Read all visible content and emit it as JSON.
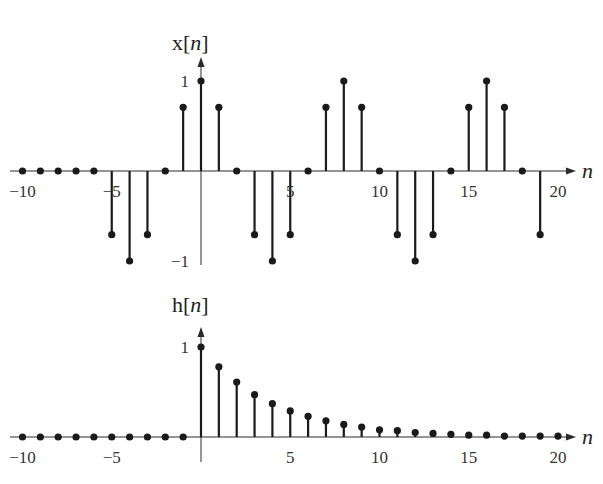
{
  "chart_data": [
    {
      "type": "stem",
      "title": "x[n]",
      "title_parts": {
        "prefix": "x[",
        "var": "n",
        "suffix": "]"
      },
      "xlabel": "n",
      "ylabel": "x[n]",
      "xlim": [
        -10,
        20
      ],
      "ylim": [
        -1,
        1
      ],
      "x_ticks": [
        -10,
        -5,
        5,
        10,
        15,
        20
      ],
      "x_tick_labels": [
        "−10",
        "−5",
        "5",
        "10",
        "15",
        "20"
      ],
      "y_ticks": [
        1,
        -1
      ],
      "y_tick_labels": [
        "1",
        "−1"
      ],
      "x": [
        -10,
        -9,
        -8,
        -7,
        -6,
        -5,
        -4,
        -3,
        -2,
        -1,
        0,
        1,
        2,
        3,
        4,
        5,
        6,
        7,
        8,
        9,
        10,
        11,
        12,
        13,
        14,
        15,
        16,
        17,
        18,
        19
      ],
      "values": [
        0,
        0,
        0,
        0,
        0,
        -0.707,
        -1,
        -0.707,
        0,
        0.707,
        1,
        0.707,
        0,
        -0.707,
        -1,
        -0.707,
        0,
        0.707,
        1,
        0.707,
        0,
        -0.707,
        -1,
        -0.707,
        0,
        0.707,
        1,
        0.707,
        0,
        -0.707
      ],
      "grid": false,
      "legend": null
    },
    {
      "type": "stem",
      "title": "h[n]",
      "title_parts": {
        "prefix": "h[",
        "var": "n",
        "suffix": "]"
      },
      "xlabel": "n",
      "ylabel": "h[n]",
      "xlim": [
        -10,
        20
      ],
      "ylim": [
        0,
        1
      ],
      "x_ticks": [
        -10,
        -5,
        5,
        10,
        15,
        20
      ],
      "x_tick_labels": [
        "−10",
        "−5",
        "5",
        "10",
        "15",
        "20"
      ],
      "y_ticks": [
        1
      ],
      "y_tick_labels": [
        "1"
      ],
      "x": [
        -10,
        -9,
        -8,
        -7,
        -6,
        -5,
        -4,
        -3,
        -2,
        -1,
        0,
        1,
        2,
        3,
        4,
        5,
        6,
        7,
        8,
        9,
        10,
        11,
        12,
        13,
        14,
        15,
        16,
        17,
        18,
        19,
        20
      ],
      "values": [
        0,
        0,
        0,
        0,
        0,
        0,
        0,
        0,
        0,
        0,
        1,
        0.78,
        0.61,
        0.47,
        0.37,
        0.29,
        0.23,
        0.18,
        0.14,
        0.11,
        0.08,
        0.07,
        0.05,
        0.04,
        0.03,
        0.02,
        0.02,
        0.01,
        0.01,
        0.01,
        0.01
      ],
      "grid": false,
      "legend": null
    }
  ]
}
